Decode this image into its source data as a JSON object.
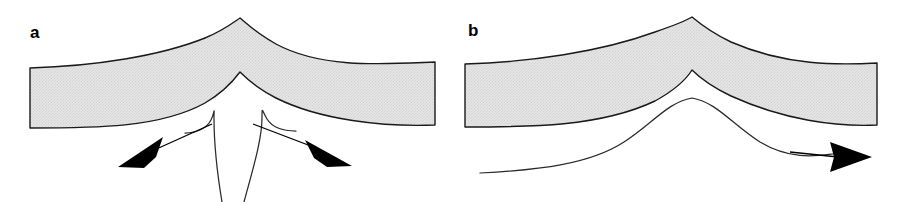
{
  "figure": {
    "type": "scientific-line-diagram",
    "background_color": "#ffffff",
    "width": 903,
    "height": 202,
    "panel_count": 2
  },
  "panels": [
    {
      "id": "a",
      "label": "a",
      "label_x": 30,
      "label_y": 38,
      "flow_pattern": "divergent",
      "arrow_count": 2,
      "band": {
        "name": "cusped-gray-band",
        "fill_color": "#e2e2e2",
        "stroke_color": "#1a1a1a",
        "stroke_width": 1.4,
        "x_start": 30,
        "x_end": 435,
        "apex_x": 240,
        "apex_y": 18,
        "top_edge_left_y": 68,
        "top_edge_right_y": 62,
        "bottom_edge_left_y": 128,
        "bottom_edge_right_y": 125
      },
      "streamlines": [
        {
          "name": "left-descending-streamline",
          "stroke_color": "#2a2a2a",
          "stroke_width": 1.2,
          "shoulder_x": 213,
          "shoulder_y": 116,
          "bottom_x": 222,
          "bottom_y": 202
        },
        {
          "name": "right-descending-streamline",
          "stroke_color": "#2a2a2a",
          "stroke_width": 1.2,
          "shoulder_x": 252,
          "shoulder_y": 116,
          "bottom_x": 244,
          "bottom_y": 202
        }
      ],
      "arrows": [
        {
          "name": "left-divergent-arrow",
          "direction": "down-left",
          "fill_color": "#000000",
          "tail_x": 212,
          "tail_y": 124,
          "tip_x": 118,
          "tip_y": 167
        },
        {
          "name": "right-divergent-arrow",
          "direction": "down-right",
          "fill_color": "#000000",
          "tail_x": 253,
          "tail_y": 124,
          "tip_x": 352,
          "tip_y": 166
        }
      ]
    },
    {
      "id": "b",
      "label": "b",
      "label_x": 468,
      "label_y": 36,
      "flow_pattern": "translational",
      "arrow_count": 1,
      "band": {
        "name": "cusped-gray-band",
        "fill_color": "#e2e2e2",
        "stroke_color": "#1a1a1a",
        "stroke_width": 1.4,
        "x_start": 465,
        "x_end": 877,
        "apex_x": 692,
        "apex_y": 17,
        "top_edge_left_y": 64,
        "top_edge_right_y": 63,
        "bottom_edge_left_y": 127,
        "bottom_edge_right_y": 125
      },
      "streamlines": [
        {
          "name": "bell-crest-streamline",
          "stroke_color": "#2a2a2a",
          "stroke_width": 1.2,
          "start_x": 480,
          "start_y": 173,
          "crest_x": 692,
          "crest_y": 98,
          "end_x": 833,
          "end_y": 156
        }
      ],
      "arrows": [
        {
          "name": "rightward-flow-arrow",
          "direction": "right",
          "fill_color": "#000000",
          "tail_x": 790,
          "tail_y": 152,
          "tip_x": 872,
          "tip_y": 157
        }
      ]
    }
  ],
  "colors": {
    "band_fill": "#e2e2e2",
    "outline": "#1a1a1a",
    "streamline": "#2a2a2a",
    "arrow": "#000000",
    "background": "#ffffff"
  }
}
